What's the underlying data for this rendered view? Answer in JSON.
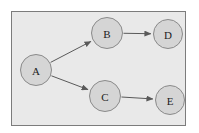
{
  "diagram": {
    "type": "directed-graph",
    "title": "",
    "panel": {
      "name": "graph-panel",
      "background_color": "#e9e9e9",
      "border_color": "#7c7c7c",
      "border_width": 1,
      "x": 11,
      "y": 11,
      "width": 175,
      "height": 115
    },
    "canvas": {
      "width": 199,
      "height": 133,
      "background_color": "#ffffff"
    },
    "node_style": {
      "fill_color": "#d5d5d5",
      "stroke_color": "#8a8a8a",
      "stroke_width": 1,
      "label_color": "#1c1c1c"
    },
    "edge_style": {
      "stroke_color": "#5a5a5a",
      "stroke_width": 1,
      "arrowhead": "solid-triangle"
    },
    "nodes": [
      {
        "id": "A",
        "label": "A",
        "cx": 36,
        "cy": 70,
        "r": 16
      },
      {
        "id": "B",
        "label": "B",
        "cx": 107,
        "cy": 33,
        "r": 16
      },
      {
        "id": "C",
        "label": "C",
        "cx": 105,
        "cy": 96,
        "r": 16
      },
      {
        "id": "D",
        "label": "D",
        "cx": 168,
        "cy": 34,
        "r": 15
      },
      {
        "id": "E",
        "label": "E",
        "cx": 170,
        "cy": 100,
        "r": 15
      }
    ],
    "edges": [
      {
        "id": "A-B",
        "from": "A",
        "to": "B",
        "label": ""
      },
      {
        "id": "A-C",
        "from": "A",
        "to": "C",
        "label": ""
      },
      {
        "id": "B-D",
        "from": "B",
        "to": "D",
        "label": ""
      },
      {
        "id": "C-E",
        "from": "C",
        "to": "E",
        "label": ""
      }
    ]
  }
}
